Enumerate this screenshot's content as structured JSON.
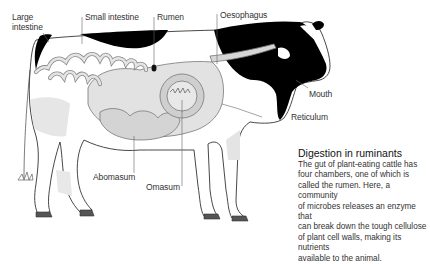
{
  "diagram": {
    "labels": {
      "large_intestine_line1": "Large",
      "large_intestine_line2": "intestine",
      "small_intestine": "Small intestine",
      "rumen": "Rumen",
      "oesophagus": "Oesophagus",
      "mouth": "Mouth",
      "reticulum": "Reticulum",
      "abomasum": "Abomasum",
      "omasum": "Omasum"
    },
    "caption": {
      "title": "Digestion in ruminants",
      "lines": [
        "The gut of plant-eating cattle has",
        "four chambers, one of which is",
        "called the rumen. Here, a community",
        "of microbes releases an enzyme that",
        "can break down the tough cellulose",
        "of plant cell walls, making its nutrients",
        "available to the animal."
      ]
    },
    "colors": {
      "background": "#ffffff",
      "cow_patch": "#000000",
      "gut_fill": "#d9d9d9",
      "outline": "#333333",
      "leader_line": "#555555"
    }
  }
}
